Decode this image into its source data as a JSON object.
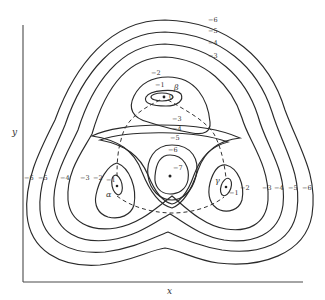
{
  "figure": {
    "type": "contour-diagram",
    "axes": {
      "x_label": "x",
      "y_label": "y"
    },
    "minima": [
      {
        "name": "alpha",
        "symbol": "α",
        "value": "-1",
        "inner_value": "-1"
      },
      {
        "name": "beta",
        "symbol": "β",
        "value": "-1",
        "inner_value": "0"
      },
      {
        "name": "gamma",
        "symbol": "γ",
        "value": "-1",
        "inner_value": "-1"
      }
    ],
    "central_extremum": {
      "value": "-7",
      "ring_labels": [
        "-6",
        "-5",
        "-4",
        "-3"
      ]
    },
    "top_labels": [
      "-6",
      "-5",
      "-4",
      "-3",
      "-2",
      "-1",
      "0"
    ],
    "left_labels": [
      "-6",
      "-5",
      "-4",
      "-3",
      "-2",
      "-1"
    ],
    "right_labels": [
      "-2",
      "-3",
      "-4",
      "-5",
      "-6"
    ],
    "alpha_label": "α",
    "beta_label": "β",
    "gamma_label": "γ",
    "center_min_label": "-7",
    "center_ring_6": "-6",
    "center_ring_5": "-5",
    "center_ring_4": "-4",
    "center_ring_3": "-3",
    "beta_inner_label": "-1",
    "beta_zero_label": "0",
    "beta_outer_label": "-2",
    "gamma_inner_label": "-1",
    "alpha_inner_label": "-1",
    "legend": null
  }
}
